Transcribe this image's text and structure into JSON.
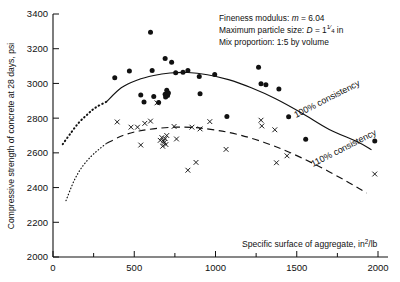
{
  "chart_data": {
    "type": "scatter",
    "title": "",
    "xlabel": "Specific surface of aggregate, in²/lb",
    "ylabel": "Compressive strength of concrete at 28 days, psi",
    "xlim": [
      0,
      2000
    ],
    "ylim": [
      2000,
      3400
    ],
    "xticks": [
      0,
      500,
      1000,
      1500,
      2000
    ],
    "xticklabels": [
      "0",
      "500",
      "1000",
      "1500",
      "2000"
    ],
    "xminorticks": [
      250,
      750,
      1250,
      1750
    ],
    "yticks": [
      2000,
      2200,
      2400,
      2600,
      2800,
      3000,
      3200,
      3400
    ],
    "yticklabels": [
      "2000",
      "2200",
      "2400",
      "2600",
      "2800",
      "3000",
      "3200",
      "3400"
    ],
    "grid": false,
    "legend_position": "inline-curve-labels",
    "series": [
      {
        "name": "100% consistency",
        "marker": "filled-circle",
        "points": [
          [
            380,
            3032
          ],
          [
            470,
            3072
          ],
          [
            540,
            2933
          ],
          [
            560,
            2893
          ],
          [
            600,
            3295
          ],
          [
            610,
            3075
          ],
          [
            620,
            2925
          ],
          [
            650,
            2890
          ],
          [
            690,
            3143
          ],
          [
            690,
            2938
          ],
          [
            693,
            2922
          ],
          [
            700,
            2960
          ],
          [
            705,
            2930
          ],
          [
            710,
            2945
          ],
          [
            730,
            3122
          ],
          [
            755,
            3062
          ],
          [
            800,
            3065
          ],
          [
            830,
            3075
          ],
          [
            900,
            3040
          ],
          [
            905,
            2940
          ],
          [
            995,
            3052
          ],
          [
            1070,
            2810
          ],
          [
            1265,
            3093
          ],
          [
            1280,
            2998
          ],
          [
            1310,
            2993
          ],
          [
            1390,
            2968
          ],
          [
            1450,
            2808
          ],
          [
            1555,
            2678
          ],
          [
            1980,
            2668
          ]
        ]
      },
      {
        "name": "110% consistency",
        "marker": "cross",
        "points": [
          [
            395,
            2778
          ],
          [
            480,
            2748
          ],
          [
            520,
            2748
          ],
          [
            540,
            2645
          ],
          [
            565,
            2770
          ],
          [
            600,
            2783
          ],
          [
            640,
            2888
          ],
          [
            660,
            2672
          ],
          [
            670,
            2688
          ],
          [
            675,
            2638
          ],
          [
            680,
            2668
          ],
          [
            685,
            2660
          ],
          [
            690,
            2682
          ],
          [
            695,
            2648
          ],
          [
            700,
            2700
          ],
          [
            745,
            2752
          ],
          [
            760,
            2680
          ],
          [
            830,
            2500
          ],
          [
            855,
            2748
          ],
          [
            880,
            2545
          ],
          [
            905,
            2738
          ],
          [
            965,
            2780
          ],
          [
            1065,
            2620
          ],
          [
            1280,
            2788
          ],
          [
            1285,
            2755
          ],
          [
            1365,
            2733
          ],
          [
            1375,
            2543
          ],
          [
            1440,
            2583
          ],
          [
            1980,
            2478
          ]
        ]
      }
    ],
    "curves": [
      {
        "name": "100% consistency",
        "style": "solid",
        "label": "100% consistency",
        "fit": [
          [
            330,
            2895
          ],
          [
            420,
            2975
          ],
          [
            520,
            3020
          ],
          [
            620,
            3046
          ],
          [
            720,
            3060
          ],
          [
            830,
            3063
          ],
          [
            950,
            3050
          ],
          [
            1080,
            3022
          ],
          [
            1220,
            2975
          ],
          [
            1370,
            2912
          ],
          [
            1530,
            2830
          ],
          [
            1700,
            2735
          ],
          [
            1870,
            2665
          ],
          [
            1960,
            2618
          ]
        ],
        "extrapolation_style": "dotted",
        "extrapolation": [
          [
            60,
            2650
          ],
          [
            110,
            2715
          ],
          [
            160,
            2775
          ],
          [
            210,
            2820
          ],
          [
            260,
            2860
          ],
          [
            330,
            2895
          ]
        ]
      },
      {
        "name": "110% consistency",
        "style": "dashed",
        "label": "110% consistency",
        "fit": [
          [
            330,
            2655
          ],
          [
            430,
            2700
          ],
          [
            530,
            2726
          ],
          [
            640,
            2741
          ],
          [
            760,
            2748
          ],
          [
            880,
            2745
          ],
          [
            1010,
            2730
          ],
          [
            1150,
            2703
          ],
          [
            1300,
            2660
          ],
          [
            1450,
            2605
          ],
          [
            1620,
            2530
          ],
          [
            1800,
            2440
          ],
          [
            1930,
            2368
          ]
        ],
        "extrapolation_style": "dotted",
        "extrapolation": [
          [
            80,
            2325
          ],
          [
            130,
            2440
          ],
          [
            180,
            2520
          ],
          [
            235,
            2580
          ],
          [
            285,
            2622
          ],
          [
            330,
            2655
          ]
        ]
      }
    ],
    "annotations": [
      {
        "text_prefix": "Fineness modulus: ",
        "symbol": "m",
        "text_suffix": " = 6.04"
      },
      {
        "text_prefix": "Maximum particle size: ",
        "symbol": "D",
        "text_suffix": " = 1",
        "frac_num": "1",
        "frac_den": "4",
        "unit": " in"
      },
      {
        "text_prefix": "Mix proportion: 1:5 by volume"
      }
    ]
  },
  "labels": {
    "ylabel": "Compressive strength of concrete at 28 days, psi",
    "xlabel_pre": "Specific surface of aggregate, in",
    "xlabel_sup": "2",
    "xlabel_post": "/lb",
    "anno1_pre": "Fineness modulus: ",
    "anno1_sym": "m",
    "anno1_post": " = 6.04",
    "anno2_pre": "Maximum particle size: ",
    "anno2_sym": "D",
    "anno2_mid": " = 1",
    "anno2_num": "1",
    "anno2_den": "4",
    "anno2_post": " in",
    "anno3": "Mix proportion: 1:5 by volume",
    "curve1": "100% consistency",
    "curve2": "110% consistency"
  }
}
